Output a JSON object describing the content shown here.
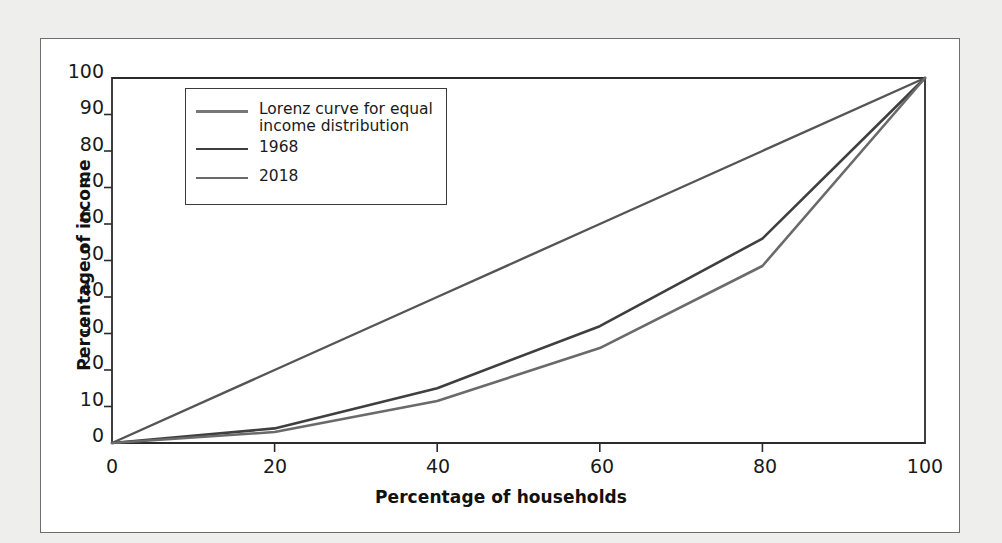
{
  "figure": {
    "background_color": "#eeeeec",
    "plot_background_color": "#ffffff",
    "frame_color": "#6e6e6e"
  },
  "chart_data": {
    "type": "line",
    "title": "",
    "xlabel": "Percentage of households",
    "ylabel": "Percentage of income",
    "xlim": [
      0,
      100
    ],
    "ylim": [
      0,
      100
    ],
    "xticks": [
      0,
      20,
      40,
      60,
      80,
      100
    ],
    "yticks": [
      0,
      10,
      20,
      30,
      40,
      50,
      60,
      70,
      80,
      90,
      100
    ],
    "grid": false,
    "legend_position": "upper left",
    "x": [
      0,
      20,
      40,
      60,
      80,
      100
    ],
    "series": [
      {
        "name": "Lorenz curve for equal\nincome distribution",
        "color": "#555555",
        "width": 2.4,
        "values": [
          0,
          20,
          40,
          60,
          80,
          100
        ]
      },
      {
        "name": "1968",
        "color": "#3f3f3f",
        "width": 2.6,
        "values": [
          0,
          4,
          15,
          32,
          56,
          100
        ]
      },
      {
        "name": "2018",
        "color": "#6a6a6a",
        "width": 2.6,
        "values": [
          0,
          3,
          11.5,
          26,
          48.5,
          100
        ]
      }
    ]
  },
  "axes": {
    "x_tick_labels": [
      "0",
      "20",
      "40",
      "60",
      "80",
      "100"
    ],
    "y_tick_labels": [
      "0",
      "10",
      "20",
      "30",
      "40",
      "50",
      "60",
      "70",
      "80",
      "90",
      "100"
    ],
    "x_title": "Percentage of households",
    "y_title": "Percentage of income"
  },
  "legend": {
    "border_color": "#3a3a3a",
    "entries": [
      {
        "label": "Lorenz curve for equal\nincome distribution",
        "color": "#777777"
      },
      {
        "label": "1968",
        "color": "#3f3f3f"
      },
      {
        "label": "2018",
        "color": "#6a6a6a"
      }
    ]
  }
}
